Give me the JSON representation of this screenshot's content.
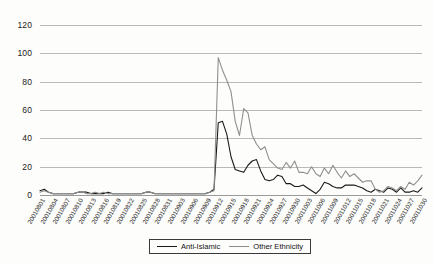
{
  "chart_data": {
    "type": "line",
    "title": "",
    "subtitle": "",
    "xlabel": "",
    "ylabel": "",
    "ylim": [
      0,
      120
    ],
    "yticks": [
      0,
      20,
      40,
      60,
      80,
      100,
      120
    ],
    "grid": true,
    "legend_position": "bottom",
    "xtick_step": 3,
    "x": [
      "20010801",
      "20010802",
      "20010803",
      "20010804",
      "20010805",
      "20010806",
      "20010807",
      "20010808",
      "20010809",
      "20010810",
      "20010811",
      "20010812",
      "20010813",
      "20010814",
      "20010815",
      "20010816",
      "20010817",
      "20010818",
      "20010819",
      "20010820",
      "20010821",
      "20010822",
      "20010823",
      "20010824",
      "20010825",
      "20010826",
      "20010827",
      "20010828",
      "20010829",
      "20010830",
      "20010831",
      "20010901",
      "20010902",
      "20010903",
      "20010904",
      "20010905",
      "20010906",
      "20010907",
      "20010908",
      "20010909",
      "20010910",
      "20010911",
      "20010912",
      "20010913",
      "20010914",
      "20010915",
      "20010916",
      "20010917",
      "20010918",
      "20010919",
      "20010920",
      "20010921",
      "20010922",
      "20010923",
      "20010924",
      "20010925",
      "20010926",
      "20010927",
      "20010928",
      "20010929",
      "20010930",
      "20011001",
      "20011002",
      "20011003",
      "20011004",
      "20011005",
      "20011006",
      "20011007",
      "20011008",
      "20011009",
      "20011010",
      "20011011",
      "20011012",
      "20011013",
      "20011014",
      "20011015",
      "20011016",
      "20011017",
      "20011018",
      "20011019",
      "20011020",
      "20011021",
      "20011022",
      "20011023",
      "20011024",
      "20011025",
      "20011026",
      "20011027",
      "20011028",
      "20011029",
      "20011030"
    ],
    "xticks": [
      "20010801",
      "20010804",
      "20010807",
      "20010810",
      "20010813",
      "20010816",
      "20010819",
      "20010822",
      "20010825",
      "20010828",
      "20010831",
      "20010903",
      "20010906",
      "20010909",
      "20010912",
      "20010915",
      "20010918",
      "20010921",
      "20010924",
      "20010927",
      "20010930",
      "20011003",
      "20011006",
      "20011009",
      "20011012",
      "20011015",
      "20011018",
      "20011021",
      "20011024",
      "20011027",
      "20011030"
    ],
    "series": [
      {
        "name": "Anti-Islamic",
        "color": "#1a1a1a",
        "values": [
          3,
          4,
          2,
          1,
          1,
          1,
          1,
          1,
          1,
          2,
          2,
          2,
          1,
          1,
          1,
          1,
          2,
          1,
          1,
          1,
          1,
          1,
          1,
          1,
          1,
          2,
          2,
          1,
          1,
          1,
          1,
          1,
          1,
          1,
          1,
          1,
          1,
          1,
          1,
          1,
          2,
          4,
          51,
          52,
          43,
          27,
          18,
          17,
          16,
          21,
          24,
          25,
          17,
          11,
          10,
          11,
          14,
          13,
          8,
          8,
          6,
          6,
          7,
          5,
          3,
          1,
          4,
          9,
          8,
          6,
          5,
          5,
          7,
          7,
          7,
          6,
          5,
          3,
          2,
          4,
          3,
          2,
          5,
          4,
          2,
          5,
          2,
          2,
          3,
          2,
          5
        ]
      },
      {
        "name": "Other Ethnicity",
        "color": "#8f8f8f",
        "values": [
          2,
          3,
          2,
          1,
          1,
          1,
          1,
          1,
          1,
          2,
          2,
          1,
          1,
          2,
          1,
          2,
          1,
          1,
          1,
          1,
          1,
          1,
          1,
          1,
          1,
          2,
          2,
          1,
          1,
          1,
          1,
          1,
          1,
          1,
          1,
          1,
          1,
          1,
          1,
          1,
          2,
          3,
          97,
          88,
          81,
          73,
          52,
          42,
          61,
          58,
          42,
          36,
          32,
          34,
          25,
          22,
          19,
          18,
          23,
          19,
          24,
          16,
          16,
          15,
          20,
          15,
          13,
          19,
          15,
          21,
          16,
          12,
          17,
          13,
          15,
          12,
          9,
          10,
          10,
          4,
          2,
          3,
          6,
          5,
          3,
          6,
          4,
          9,
          7,
          10,
          14
        ]
      }
    ]
  },
  "legend": {
    "entries": [
      {
        "label": "Anti-Islamic"
      },
      {
        "label": "Other Ethnicity"
      }
    ]
  }
}
